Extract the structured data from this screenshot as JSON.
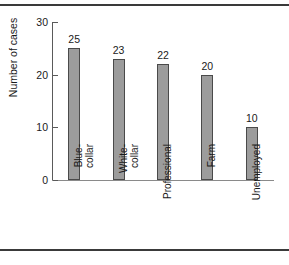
{
  "figure": {
    "background_color": "#ffffff",
    "rule_color": "#3a3a3a",
    "bar_fill_color": "#9c9c9c",
    "bar_edge_color": "#4a4a4a",
    "axis_color": "#5a5a5a"
  },
  "chart_data": {
    "type": "bar",
    "title": "",
    "subtitle": "",
    "xlabel": "",
    "ylabel": "Number of cases",
    "categories": [
      "Blue-\ncollar",
      "White-\ncollar",
      "Professional",
      "Farm",
      "Unemployed"
    ],
    "values": [
      25,
      23,
      22,
      20,
      10
    ],
    "data_labels": [
      "25",
      "23",
      "22",
      "20",
      "10"
    ],
    "ylim": [
      0,
      30
    ],
    "yticks": [
      0,
      10,
      20,
      30
    ],
    "ytick_labels": [
      "0",
      "10",
      "20",
      "30"
    ],
    "grid": false,
    "legend": null,
    "legend_position": "none",
    "annotations": []
  }
}
